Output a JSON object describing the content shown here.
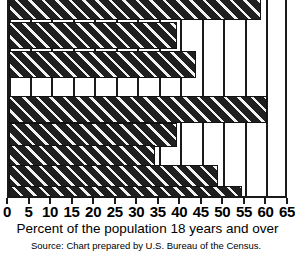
{
  "chart_data": {
    "type": "bar",
    "orientation": "horizontal",
    "title": "",
    "subtitle": "",
    "xlabel": "Percent of the population 18 years and over",
    "ylabel": "",
    "xlim": [
      0,
      65
    ],
    "xticks": [
      0,
      5,
      10,
      15,
      20,
      25,
      30,
      35,
      40,
      45,
      50,
      55,
      60,
      65
    ],
    "xtick_labels": [
      "0",
      "5",
      "10",
      "15",
      "20",
      "25",
      "30",
      "35",
      "40",
      "45",
      "50",
      "55",
      "60",
      "65"
    ],
    "grid": true,
    "grid_axis": "x",
    "legend": false,
    "categories": [
      "",
      "",
      "",
      "",
      "",
      "",
      "",
      ""
    ],
    "values": [
      58.5,
      39.0,
      43.5,
      60.0,
      39.0,
      34.0,
      48.5,
      54.0
    ],
    "bar_fill": "hatched-diagonal-dark",
    "bar_color": "#1f1f1f",
    "hatch_color": "#f2f2f2",
    "axis_color": "#1a1a1a",
    "background": "#ffffff",
    "note": "top bar is clipped by the top edge of the screenshot; a blank row gap separates bar 3 and bar 4"
  },
  "axis": {
    "x_label": "Percent of the population 18 years and over",
    "tick_labels": [
      "0",
      "5",
      "10",
      "15",
      "20",
      "25",
      "30",
      "35",
      "40",
      "45",
      "50",
      "55",
      "60",
      "65"
    ]
  },
  "footer": {
    "source": "Source: Chart prepared by U.S. Bureau of the Census."
  }
}
